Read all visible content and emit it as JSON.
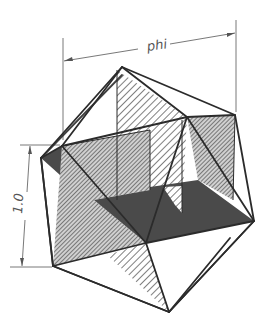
{
  "diagram": {
    "dimensions": {
      "width_label": "phi",
      "height_label": "1.0"
    },
    "colors": {
      "edge": "#2b2b2b",
      "dark_plane": "#4a4a4a",
      "gray_hatch_bg": "#c8c8c8",
      "white_hatch_bg": "#ffffff",
      "hatch_line": "#3a3a3a",
      "dimension_line": "#555555"
    },
    "planes": [
      {
        "name": "vertical-front-rectangle",
        "fill": "gray-hatched"
      },
      {
        "name": "vertical-side-rectangle",
        "fill": "white-hatched"
      },
      {
        "name": "horizontal-rectangle",
        "fill": "dark-solid"
      }
    ]
  }
}
